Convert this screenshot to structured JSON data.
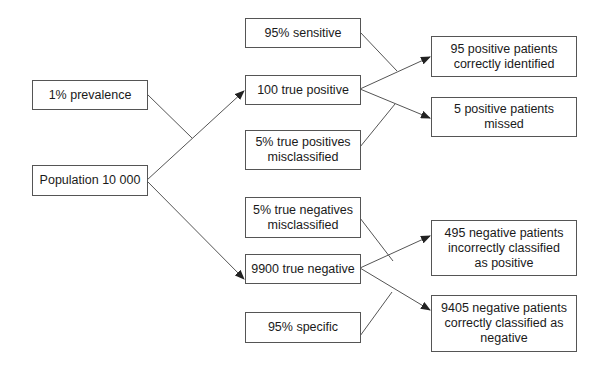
{
  "diagram": {
    "type": "flowchart",
    "nodes": {
      "prevalence": "1% prevalence",
      "population": "Population 10 000",
      "sensitive": "95% sensitive",
      "true_positive": "100 true positive",
      "tp_misclassified": "5% true positives misclassified",
      "pos_identified": "95 positive patients correctly identified",
      "pos_missed": "5 positive patients missed",
      "tn_misclassified": "5% true negatives misclassified",
      "true_negative": "9900 true negative",
      "specific": "95% specific",
      "neg_incorrect": "495 negative patients incorrectly classified as positive",
      "neg_correct": "9405 negative patients correctly classified as negative"
    },
    "edges": [
      {
        "from": "population",
        "to": "true_positive",
        "modifier": "prevalence"
      },
      {
        "from": "population",
        "to": "true_negative"
      },
      {
        "from": "true_positive",
        "to": "pos_identified",
        "modifier": "sensitive"
      },
      {
        "from": "true_positive",
        "to": "pos_missed",
        "modifier": "tp_misclassified"
      },
      {
        "from": "true_negative",
        "to": "neg_incorrect",
        "modifier": "tn_misclassified"
      },
      {
        "from": "true_negative",
        "to": "neg_correct",
        "modifier": "specific"
      }
    ],
    "colors": {
      "line": "#555555",
      "border": "#555555",
      "text": "#1a1a1a",
      "background": "#ffffff"
    }
  }
}
